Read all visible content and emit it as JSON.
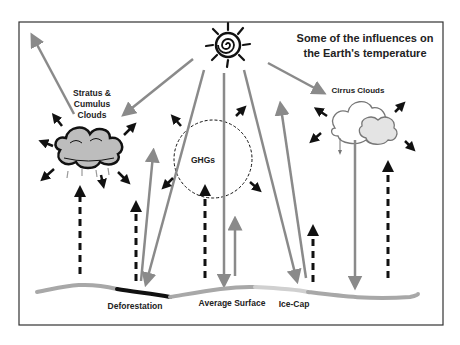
{
  "title": {
    "line1": "Some of the influences on",
    "line2": "the Earth's temperature"
  },
  "labels": {
    "stratus_line1": "Stratus &",
    "stratus_line2": "Cumulus",
    "stratus_line3": "Clouds",
    "cirrus": "Cirrus Clouds",
    "ghgs": "GHGs",
    "deforestation": "Deforestation",
    "average_surface": "Average Surface",
    "ice_cap": "Ice-Cap"
  },
  "icons": {
    "sun": "sun-icon",
    "stratus_cloud": "stratus-cumulus-cloud-icon",
    "cirrus_cloud": "cirrus-cloud-icon",
    "ghg_region": "dashed-circle"
  },
  "colors": {
    "frame": "#333333",
    "solar_arrow": "#8a8a8a",
    "heat_arrow": "#111111",
    "surface": "#a8a8a8",
    "deforestation": "#111111",
    "ice_cap": "#d0d0d0",
    "cloud_fill": "#bdbdbd"
  }
}
